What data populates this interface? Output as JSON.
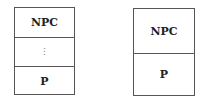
{
  "diagrams": [
    {
      "cells": [
        "NPC",
        "⋮",
        "P"
      ]
    },
    {
      "cells": [
        "NPC",
        "P"
      ]
    }
  ]
}
